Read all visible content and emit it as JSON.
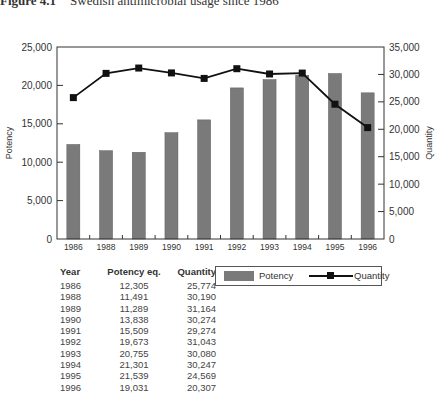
{
  "caption": {
    "label": "Figure 4.1",
    "title": "Swedish antimicrobial usage since 1986"
  },
  "chart_data": {
    "type": "bar+line",
    "title": "Swedish antimicrobial usage since 1986",
    "categories": [
      "1986",
      "1988",
      "1989",
      "1990",
      "1991",
      "1992",
      "1993",
      "1994",
      "1995",
      "1996"
    ],
    "series": [
      {
        "name": "Potency",
        "type": "bar",
        "axis": "left",
        "color": "#7a7a7a",
        "values": [
          12305,
          11491,
          11289,
          13838,
          15509,
          19673,
          20755,
          21301,
          21539,
          19031
        ]
      },
      {
        "name": "Quantity",
        "type": "line",
        "axis": "right",
        "color": "#111111",
        "marker": "square",
        "values": [
          25774,
          30190,
          31164,
          30274,
          29274,
          31043,
          30080,
          30247,
          24569,
          20307
        ]
      }
    ],
    "xlabel": "",
    "ylabel": "Potency",
    "y2label": "Quantity",
    "ylim": [
      0,
      25000
    ],
    "y2lim": [
      0,
      35000
    ],
    "yticks": [
      "0",
      "5,000",
      "10,000",
      "15,000",
      "20,000",
      "25,000"
    ],
    "y2ticks": [
      "0",
      "5,000",
      "10,000",
      "15,000",
      "20,000",
      "25,000",
      "30,000",
      "35,000"
    ],
    "grid": false,
    "legend_position": "below-right"
  },
  "table": {
    "headers": [
      "Year",
      "Potency eq.",
      "Quantity"
    ],
    "rows": [
      [
        "1986",
        "12,305",
        "25,774"
      ],
      [
        "1988",
        "11,491",
        "30,190"
      ],
      [
        "1989",
        "11,289",
        "31,164"
      ],
      [
        "1990",
        "13,838",
        "30,274"
      ],
      [
        "1991",
        "15,509",
        "29,274"
      ],
      [
        "1992",
        "19,673",
        "31,043"
      ],
      [
        "1993",
        "20,755",
        "30,080"
      ],
      [
        "1994",
        "21,301",
        "30,247"
      ],
      [
        "1995",
        "21,539",
        "24,569"
      ],
      [
        "1996",
        "19,031",
        "20,307"
      ]
    ]
  },
  "legend": {
    "potency": "Potency",
    "quantity": "Quantity"
  }
}
